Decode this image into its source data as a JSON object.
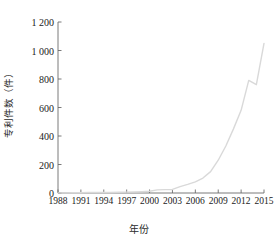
{
  "chart_data": {
    "type": "line",
    "title": "",
    "xlabel": "年份",
    "ylabel": "专利件数（件）",
    "xlim": [
      1988,
      2015
    ],
    "ylim": [
      0,
      1200
    ],
    "grid": false,
    "legend": null,
    "line_color": "#d9d9d9",
    "axis_color": "#6b6b6b",
    "x_tick_labels": [
      "1988",
      "1991",
      "1994",
      "1997",
      "2000",
      "2003",
      "2006",
      "2009",
      "2012",
      "2015"
    ],
    "x_tick_values": [
      1988,
      1991,
      1994,
      1997,
      2000,
      2003,
      2006,
      2009,
      2012,
      2015
    ],
    "y_tick_labels": [
      "0",
      "200",
      "400",
      "600",
      "800",
      "1 000",
      "1 200"
    ],
    "y_tick_values": [
      0,
      200,
      400,
      600,
      800,
      1000,
      1200
    ],
    "x": [
      1988,
      1989,
      1990,
      1991,
      1992,
      1993,
      1994,
      1995,
      1996,
      1997,
      1998,
      1999,
      2000,
      2001,
      2002,
      2003,
      2004,
      2005,
      2006,
      2007,
      2008,
      2009,
      2010,
      2011,
      2012,
      2013,
      2014,
      2015
    ],
    "values": [
      1,
      1,
      2,
      2,
      3,
      3,
      4,
      4,
      5,
      6,
      7,
      9,
      12,
      22,
      24,
      25,
      45,
      60,
      78,
      105,
      150,
      230,
      330,
      450,
      580,
      790,
      760,
      1050
    ],
    "series": [
      {
        "name": "专利件数",
        "values": [
          1,
          1,
          2,
          2,
          3,
          3,
          4,
          4,
          5,
          6,
          7,
          9,
          12,
          22,
          24,
          25,
          45,
          60,
          78,
          105,
          150,
          230,
          330,
          450,
          580,
          790,
          760,
          1050
        ]
      }
    ]
  }
}
